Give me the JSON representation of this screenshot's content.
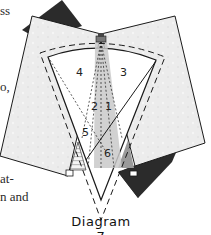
{
  "text_fragments": [
    {
      "id": "frag-1",
      "text": "ss",
      "x": 0,
      "y": 4
    },
    {
      "id": "frag-2",
      "text": "o,",
      "x": 0,
      "y": 80
    },
    {
      "id": "frag-3",
      "text": "at-",
      "x": 0,
      "y": 172
    },
    {
      "id": "frag-4",
      "text": "n and",
      "x": 0,
      "y": 190
    }
  ],
  "diagram": {
    "caption": "Diagram 7",
    "region_labels": [
      {
        "label": "4",
        "x": 79,
        "y": 76
      },
      {
        "label": "3",
        "x": 123,
        "y": 76
      },
      {
        "label": "2",
        "x": 93,
        "y": 110
      },
      {
        "label": "1",
        "x": 107,
        "y": 110
      },
      {
        "label": "5",
        "x": 84,
        "y": 134
      },
      {
        "label": "6",
        "x": 106,
        "y": 155
      }
    ],
    "colors": {
      "panel_fill": "#ececec",
      "dark_square": "#2b2b2b",
      "wedge_fill": "#ffffff",
      "center_strip": "#c9c9c9",
      "right_gray": "#9a9a9a",
      "line": "#1a1a1a"
    }
  }
}
